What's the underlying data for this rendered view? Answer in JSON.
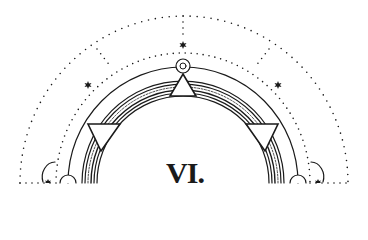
{
  "diagram": {
    "label": "VI.",
    "colors": {
      "ink": "#1a1a1a",
      "background": "#ffffff"
    },
    "center": {
      "x": 183,
      "y": 183
    },
    "elements": {
      "outer_dotted_arc_radius": 165,
      "inner_dotted_arc_radius": 128,
      "main_solid_arc_radius": 116,
      "band_arcs": [
        101,
        98,
        94,
        91,
        88,
        85
      ],
      "band_dotted_arc_radius": 96,
      "top_ring": {
        "cx": 183,
        "cy": 66,
        "r_outer": 7,
        "r_inner": 3
      },
      "stars": [
        {
          "x": 183,
          "y": 45
        },
        {
          "x": 88,
          "y": 85
        },
        {
          "x": 278,
          "y": 85
        },
        {
          "x": 48,
          "y": 183
        },
        {
          "x": 318,
          "y": 183
        }
      ],
      "triangles": [
        {
          "name": "top",
          "orientation": "up"
        },
        {
          "name": "left",
          "orientation": "down"
        },
        {
          "name": "right",
          "orientation": "down"
        }
      ]
    }
  }
}
